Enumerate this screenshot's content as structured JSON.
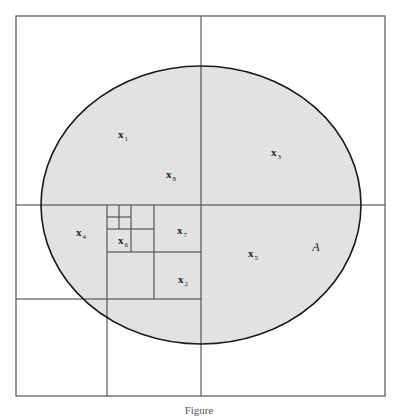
{
  "figure": {
    "type": "quadtree-partition-diagram",
    "colors": {
      "background": "#ffffff",
      "region_fill": "#e2e2e2",
      "ellipse_stroke": "#1a1a1a",
      "grid_stroke": "#3a3a3a",
      "outer_box_stroke": "#555555"
    },
    "outer_box": {
      "x1": 16,
      "y1": 16,
      "x2": 385,
      "y2": 396
    },
    "ellipse": {
      "cx": 201,
      "cy": 205,
      "rx": 160,
      "ry": 139
    },
    "region_label": {
      "text": "A",
      "x": 316,
      "y": 247
    },
    "points": [
      {
        "base": "x",
        "sub": "1",
        "x": 123,
        "y": 134
      },
      {
        "base": "x",
        "sub": "2",
        "x": 183,
        "y": 279
      },
      {
        "base": "x",
        "sub": "3",
        "x": 276,
        "y": 152
      },
      {
        "base": "x",
        "sub": "4",
        "x": 81,
        "y": 232
      },
      {
        "base": "x",
        "sub": "5",
        "x": 253,
        "y": 253
      },
      {
        "base": "x",
        "sub": "6",
        "x": 123,
        "y": 240
      },
      {
        "base": "x",
        "sub": "7",
        "x": 182,
        "y": 230
      },
      {
        "base": "x",
        "sub": "8",
        "x": 171,
        "y": 174
      }
    ],
    "caption": "Figure"
  }
}
